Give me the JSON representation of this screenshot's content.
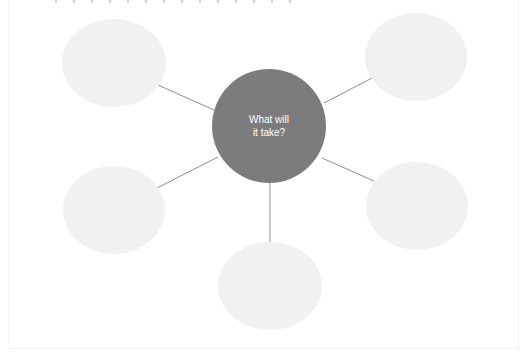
{
  "diagram": {
    "type": "mind-map",
    "center": {
      "label_lines": [
        "What will",
        "it take?"
      ],
      "fill": "#7c7c7c",
      "cx": 269,
      "cy": 126,
      "r": 57
    },
    "branch_fill": "#f1f1f1",
    "connector_color": "#8e8e8e",
    "branches": [
      {
        "id": "top-left",
        "label": "",
        "cx": 114,
        "cy": 63,
        "rx": 52,
        "ry": 44,
        "line": [
          158,
          85,
          214,
          110
        ]
      },
      {
        "id": "top-right",
        "label": "",
        "cx": 416,
        "cy": 57,
        "rx": 51,
        "ry": 44,
        "line": [
          324,
          103,
          372,
          78
        ]
      },
      {
        "id": "bottom-left",
        "label": "",
        "cx": 114,
        "cy": 210,
        "rx": 51,
        "ry": 44,
        "line": [
          157,
          188,
          218,
          157
        ]
      },
      {
        "id": "right",
        "label": "",
        "cx": 417,
        "cy": 206,
        "rx": 51,
        "ry": 44,
        "line": [
          322,
          158,
          374,
          181
        ]
      },
      {
        "id": "bottom",
        "label": "",
        "cx": 270,
        "cy": 286,
        "rx": 52,
        "ry": 44,
        "line": [
          270,
          183,
          270,
          244
        ]
      }
    ]
  }
}
